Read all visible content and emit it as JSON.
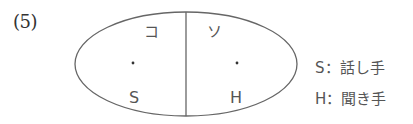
{
  "problem_number": "(5)",
  "diagram": {
    "left_region": {
      "demonstrative": "コ",
      "person": "S"
    },
    "right_region": {
      "demonstrative": "ソ",
      "person": "H"
    },
    "stroke_color": "#666666",
    "text_color": "#555555"
  },
  "legend": {
    "speaker": {
      "symbol": "S",
      "separator": "：",
      "meaning": "話し手",
      "text": "S：話し手"
    },
    "hearer": {
      "symbol": "H",
      "separator": "：",
      "meaning": "聞き手",
      "text": "H：聞き手"
    }
  }
}
